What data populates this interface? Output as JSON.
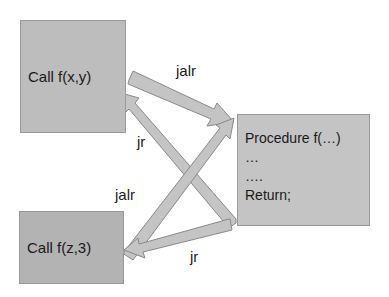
{
  "diagram": {
    "caller1": {
      "label": "Call f(x,y)"
    },
    "caller2": {
      "label": "Call f(z,3)"
    },
    "procedure": {
      "lines": [
        "Procedure f(…)",
        "…",
        "….",
        "Return;"
      ]
    },
    "edges": [
      {
        "from": "Call f(x,y)",
        "to": "Procedure f(…)",
        "label": "jalr"
      },
      {
        "from": "Procedure f(…)",
        "to": "Call f(x,y)",
        "label": "jr"
      },
      {
        "from": "Call f(z,3)",
        "to": "Procedure f(…)",
        "label": "jalr"
      },
      {
        "from": "Procedure f(…)",
        "to": "Call f(z,3)",
        "label": "jr"
      }
    ],
    "colors": {
      "box": "#bdbdbd",
      "arrow_fill": "#c2c2c2",
      "arrow_stroke": "#8a8a8a"
    }
  }
}
